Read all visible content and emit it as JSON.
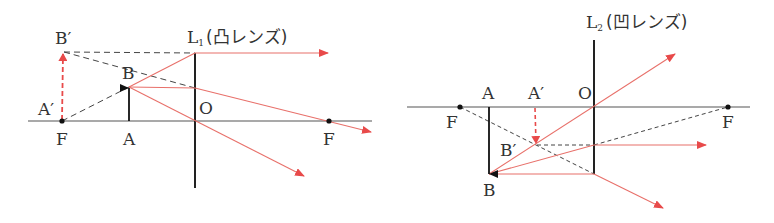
{
  "colors": {
    "axis": "#555555",
    "lens": "#222222",
    "ray": "#e8706a",
    "ray_arrow": "#e84a4a",
    "dashed": "#444444",
    "image_arrow": "#e84a4a",
    "object_arrow": "#111111"
  },
  "diagrams": [
    {
      "id": "convex",
      "lens_label": "L",
      "lens_subscript": "1",
      "lens_type": "(凸レンズ)",
      "labels": {
        "b_prime": "B′",
        "a_prime": "A′",
        "b": "B",
        "o": "O",
        "f_left": "F",
        "a": "A",
        "f_right": "F"
      }
    },
    {
      "id": "concave",
      "lens_label": "L",
      "lens_subscript": "2",
      "lens_type": "(凹レンズ)",
      "labels": {
        "a": "A",
        "a_prime": "A′",
        "o": "O",
        "f_left": "F",
        "f_right": "F",
        "b_prime": "B′",
        "b": "B"
      }
    }
  ]
}
